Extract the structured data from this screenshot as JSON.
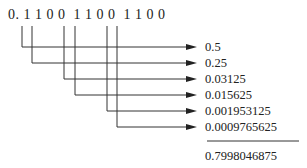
{
  "binary_fraction": "0. 1 1 0 0  1 1 0 0  1 1 0 0",
  "terms": [
    {
      "bit_position": 1,
      "value": "0.5"
    },
    {
      "bit_position": 2,
      "value": "0.25"
    },
    {
      "bit_position": 5,
      "value": "0.03125"
    },
    {
      "bit_position": 6,
      "value": "0.015625"
    },
    {
      "bit_position": 9,
      "value": "0.001953125"
    },
    {
      "bit_position": 10,
      "value": "0.0009765625"
    }
  ],
  "sum": "0.7998046875",
  "colors": {
    "line": "#333333",
    "text": "#222222"
  }
}
